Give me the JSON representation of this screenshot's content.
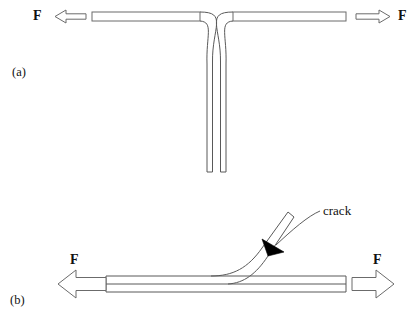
{
  "figure": {
    "background_color": "#ffffff",
    "line_color": "#6b6b6b",
    "text_color": "#111111",
    "arrowhead_fill": "#000000"
  },
  "panels": [
    {
      "id": "a",
      "caption": "(a)",
      "description": "T-peel specimen: two arms pulled apart horizontally, joined bond line running vertically downward",
      "force_left": "F",
      "force_right": "F"
    },
    {
      "id": "b",
      "caption": "(b)",
      "description": "Peeled specimen: one arm lifted at an angle from the horizontal substrate, with crack tip at the separation point",
      "force_left": "F",
      "force_right": "F"
    }
  ],
  "annotations": {
    "crack_label": "crack"
  },
  "icons": {
    "arrow_left": "arrow-left-outline-icon",
    "arrow_right": "arrow-right-outline-icon",
    "crack_pointer": "solid-triangle-pointer-icon"
  }
}
